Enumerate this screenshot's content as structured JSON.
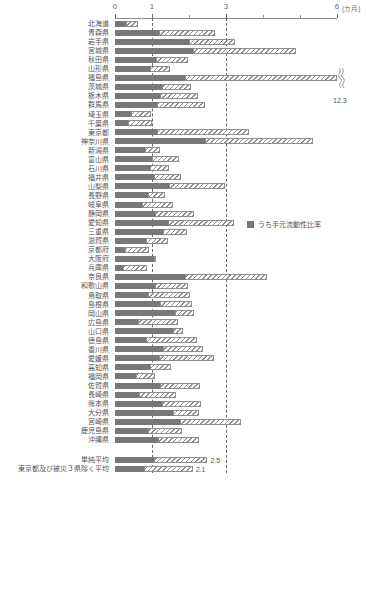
{
  "chart_data": {
    "type": "bar",
    "orientation": "horizontal",
    "stacked": true,
    "title": "",
    "xlabel": "(カ月)",
    "ylabel": "",
    "xlim": [
      0,
      6
    ],
    "xticks": [
      0,
      1,
      3,
      6
    ],
    "xtick_labels": [
      "0",
      "1",
      "3",
      "6"
    ],
    "minor_ticks": [
      2,
      4,
      5
    ],
    "gridlines": [
      1,
      3
    ],
    "grid": true,
    "unit_label": "(カ月)",
    "legend": {
      "position": "middle-right",
      "entries": [
        {
          "label": "うち手元流動性比率",
          "color": "#787878",
          "style": "solid"
        }
      ]
    },
    "series": [
      {
        "name": "うち手元流動性比率",
        "color": "#787878",
        "style": "solid"
      },
      {
        "name": "残り",
        "color": "#ffffff",
        "style": "hatch"
      }
    ],
    "categories": [
      "北海道",
      "青森県",
      "岩手県",
      "宮城県",
      "秋田県",
      "山形県",
      "福島県",
      "茨城県",
      "栃木県",
      "群馬県",
      "埼玉県",
      "千葉県",
      "東京都",
      "神奈川県",
      "新潟県",
      "富山県",
      "石川県",
      "福井県",
      "山梨県",
      "長野県",
      "岐阜県",
      "静岡県",
      "愛知県",
      "三重県",
      "滋賀県",
      "京都府",
      "大阪府",
      "兵庫県",
      "奈良県",
      "和歌山県",
      "鳥取県",
      "島根県",
      "岡山県",
      "広島県",
      "山口県",
      "徳島県",
      "香川県",
      "愛媛県",
      "高知県",
      "福岡県",
      "佐賀県",
      "長崎県",
      "熊本県",
      "大分県",
      "宮崎県",
      "鹿児島県",
      "沖縄県"
    ],
    "bars": [
      {
        "name": "北海道",
        "dark": 0.3,
        "total": 0.62
      },
      {
        "name": "青森県",
        "dark": 1.18,
        "total": 2.7
      },
      {
        "name": "岩手県",
        "dark": 2.0,
        "total": 3.23
      },
      {
        "name": "宮城県",
        "dark": 2.1,
        "total": 4.9
      },
      {
        "name": "秋田県",
        "dark": 1.12,
        "total": 1.96
      },
      {
        "name": "山形県",
        "dark": 0.94,
        "total": 1.5
      },
      {
        "name": "福島県",
        "dark": 1.88,
        "total": 12.3,
        "clipped": true,
        "value_label": "12.3"
      },
      {
        "name": "茨城県",
        "dark": 1.28,
        "total": 2.06
      },
      {
        "name": "栃木県",
        "dark": 1.21,
        "total": 2.24
      },
      {
        "name": "群馬県",
        "dark": 1.13,
        "total": 2.42
      },
      {
        "name": "埼玉県",
        "dark": 0.42,
        "total": 0.98
      },
      {
        "name": "千葉県",
        "dark": 0.35,
        "total": 1.0
      },
      {
        "name": "東京都",
        "dark": 1.14,
        "total": 3.62
      },
      {
        "name": "神奈川県",
        "dark": 2.42,
        "total": 5.36
      },
      {
        "name": "新潟県",
        "dark": 0.8,
        "total": 1.22
      },
      {
        "name": "富山県",
        "dark": 1.0,
        "total": 1.72
      },
      {
        "name": "石川県",
        "dark": 0.95,
        "total": 1.46
      },
      {
        "name": "福井県",
        "dark": 1.05,
        "total": 1.78
      },
      {
        "name": "山梨県",
        "dark": 1.45,
        "total": 2.98
      },
      {
        "name": "長野県",
        "dark": 0.9,
        "total": 1.34
      },
      {
        "name": "岐阜県",
        "dark": 0.74,
        "total": 1.58
      },
      {
        "name": "静岡県",
        "dark": 1.08,
        "total": 2.13
      },
      {
        "name": "愛知県",
        "dark": 1.43,
        "total": 3.22
      },
      {
        "name": "三重県",
        "dark": 1.3,
        "total": 1.94
      },
      {
        "name": "滋賀県",
        "dark": 0.85,
        "total": 1.44
      },
      {
        "name": "京都府",
        "dark": 0.26,
        "total": 0.92
      },
      {
        "name": "大阪府",
        "dark": 1.05,
        "total": 1.12
      },
      {
        "name": "兵庫県",
        "dark": 0.22,
        "total": 0.86
      },
      {
        "name": "奈良県",
        "dark": 1.9,
        "total": 4.1
      },
      {
        "name": "和歌山県",
        "dark": 1.08,
        "total": 1.96
      },
      {
        "name": "鳥取県",
        "dark": 0.9,
        "total": 2.04
      },
      {
        "name": "島根県",
        "dark": 1.22,
        "total": 2.08
      },
      {
        "name": "岡山県",
        "dark": 1.62,
        "total": 2.14
      },
      {
        "name": "広島県",
        "dark": 0.62,
        "total": 1.7
      },
      {
        "name": "山口県",
        "dark": 1.58,
        "total": 1.85
      },
      {
        "name": "徳島県",
        "dark": 0.85,
        "total": 2.22
      },
      {
        "name": "香川県",
        "dark": 1.3,
        "total": 2.38
      },
      {
        "name": "愛媛県",
        "dark": 1.18,
        "total": 2.68
      },
      {
        "name": "高知県",
        "dark": 0.95,
        "total": 1.52
      },
      {
        "name": "福岡県",
        "dark": 0.56,
        "total": 1.08
      },
      {
        "name": "佐賀県",
        "dark": 1.22,
        "total": 2.3
      },
      {
        "name": "長崎県",
        "dark": 0.66,
        "total": 1.64
      },
      {
        "name": "熊本県",
        "dark": 1.26,
        "total": 2.32
      },
      {
        "name": "大分県",
        "dark": 1.58,
        "total": 2.26
      },
      {
        "name": "宮崎県",
        "dark": 1.76,
        "total": 3.4
      },
      {
        "name": "鹿児島県",
        "dark": 0.88,
        "total": 1.8
      },
      {
        "name": "沖縄県",
        "dark": 1.16,
        "total": 2.26
      }
    ],
    "summary_bars": [
      {
        "name": "単純平均",
        "dark": 1.05,
        "total": 2.5,
        "value_label": "2.5"
      },
      {
        "name": "東京都及び被災３県除く平均",
        "dark": 0.78,
        "total": 2.1,
        "value_label": "2.1"
      }
    ]
  },
  "footnote": "",
  "colors": {
    "dark_segment": "#787878",
    "hatch_stroke": "#8e8e8e",
    "axis": "#8c8c8c",
    "gridline": "#666666",
    "text": "#555555"
  }
}
